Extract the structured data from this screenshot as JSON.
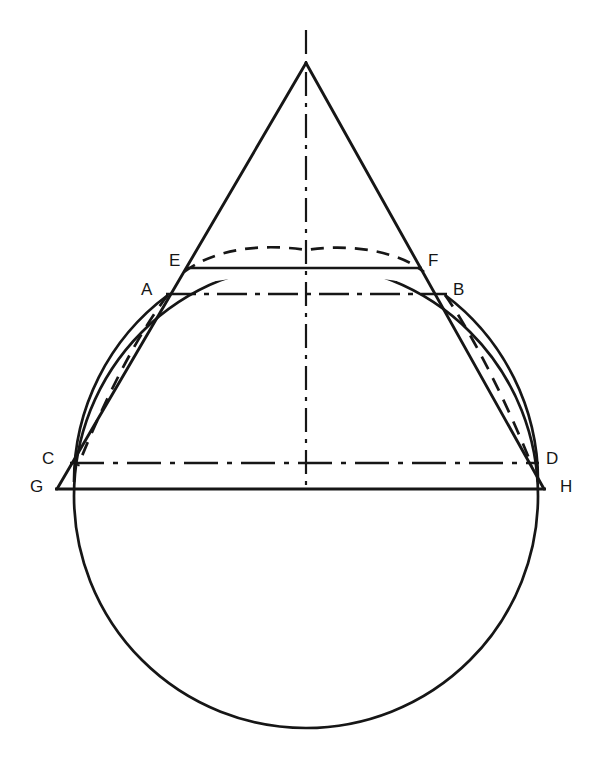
{
  "diagram": {
    "kind": "geometric-construction",
    "background_color": "#ffffff",
    "stroke_color": "#161616",
    "canvas": {
      "width": 606,
      "height": 771
    },
    "center_axis_x": 306,
    "apex": {
      "x": 306,
      "y": 63
    },
    "circle": {
      "cx": 306,
      "cy": 496,
      "r": 232
    },
    "stroke_widths": {
      "solid": 2.6,
      "dashed": 2.6,
      "dash_dot": 2.0,
      "thin": 2.2
    },
    "dash_patterns": {
      "dashed": "13 9",
      "dash_dot": "26 7 5 7",
      "center_axis": "24 7 4 7"
    },
    "labels": [
      {
        "id": "label-E",
        "text": "E",
        "x": 169,
        "y": 252
      },
      {
        "id": "label-F",
        "text": "F",
        "x": 428,
        "y": 252
      },
      {
        "id": "label-A",
        "text": "A",
        "x": 141,
        "y": 281
      },
      {
        "id": "label-B",
        "text": "B",
        "x": 453,
        "y": 281
      },
      {
        "id": "label-C",
        "text": "C",
        "x": 42,
        "y": 450
      },
      {
        "id": "label-D",
        "text": "D",
        "x": 546,
        "y": 450
      },
      {
        "id": "label-G",
        "text": "G",
        "x": 30,
        "y": 478
      },
      {
        "id": "label-H",
        "text": "H",
        "x": 560,
        "y": 478
      }
    ],
    "points": {
      "A": {
        "x": 168,
        "y": 295
      },
      "B": {
        "x": 445,
        "y": 295
      },
      "C": {
        "x": 73,
        "y": 463
      },
      "D": {
        "x": 537,
        "y": 463
      },
      "E": {
        "x": 187,
        "y": 268
      },
      "F": {
        "x": 422,
        "y": 268
      },
      "G": {
        "x": 57,
        "y": 489
      },
      "H": {
        "x": 544,
        "y": 489
      }
    },
    "chords": [
      {
        "id": "chord-EF",
        "from": "E",
        "to": "F",
        "style": "solid"
      },
      {
        "id": "chord-AB",
        "from": "A",
        "to": "B",
        "style": "dash-dot"
      },
      {
        "id": "chord-CD",
        "from": "C",
        "to": "D",
        "style": "dash-dot"
      },
      {
        "id": "chord-GH",
        "from": "G",
        "to": "H",
        "style": "solid"
      }
    ],
    "cone": {
      "left_base": {
        "x": 57,
        "y": 489
      },
      "right_base": {
        "x": 544,
        "y": 489
      }
    },
    "axis_line": {
      "x": 306,
      "y_top": 30,
      "y_bottom": 489,
      "style": "dash-dot"
    },
    "dashed_arc_top": {
      "peak_x": 306,
      "peak_y": 250,
      "left": "E",
      "right": "F"
    },
    "dashed_ellipse_sides": {
      "top_left": "A",
      "top_right": "B",
      "bottom_left": "C",
      "bottom_right": "D"
    }
  }
}
